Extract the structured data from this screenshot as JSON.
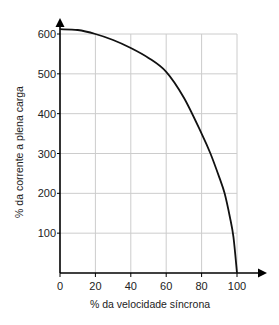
{
  "chart_data": {
    "type": "line",
    "title": "",
    "xlabel": "% da velocidade síncrona",
    "ylabel": "% da corrente a plena carga",
    "xlim": [
      0,
      100
    ],
    "ylim": [
      0,
      600
    ],
    "grid": true,
    "legend": null,
    "x_ticks": [
      "0",
      "20",
      "40",
      "60",
      "80",
      "100"
    ],
    "y_ticks": [
      "100",
      "200",
      "300",
      "400",
      "500",
      "600"
    ],
    "series": [
      {
        "name": "corrente",
        "x": [
          0,
          10,
          20,
          30,
          40,
          50,
          60,
          70,
          80,
          85,
          90,
          93,
          96,
          98,
          100
        ],
        "y": [
          612,
          610,
          600,
          585,
          565,
          540,
          505,
          440,
          350,
          300,
          240,
          200,
          140,
          90,
          0
        ]
      }
    ],
    "colors": {
      "line": "#111111",
      "grid": "#cccccc",
      "axis": "#000000"
    }
  }
}
